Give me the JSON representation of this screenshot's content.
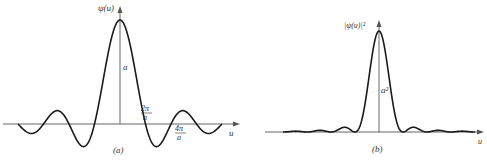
{
  "figure": {
    "panels": [
      {
        "id": "a",
        "caption": "(a)",
        "y_label": "ψ(u)",
        "x_label": "u",
        "peak_label": "a",
        "tick_labels": [
          {
            "num": "2π",
            "den": "a"
          },
          {
            "num": "4π",
            "den": "a"
          }
        ]
      },
      {
        "id": "b",
        "caption": "(b)",
        "y_label": "|ψ(u)|²",
        "x_label": "u",
        "peak_label": "a²"
      }
    ]
  },
  "chart_data": [
    {
      "type": "line",
      "title": "(a)",
      "function": "ψ(u) = a·sin(au/2)/(au/2)",
      "xlabel": "u",
      "ylabel": "ψ(u)",
      "peak_value": "a",
      "zeros_marked": [
        "2π/a",
        "4π/a"
      ],
      "x_range_in_zero_units": [
        -4,
        4
      ],
      "grid": false
    },
    {
      "type": "line",
      "title": "(b)",
      "function": "|ψ(u)|² = a²·[sin(au/2)/(au/2)]²",
      "xlabel": "u",
      "ylabel": "|ψ(u)|²",
      "peak_value": "a²",
      "x_range_in_zero_units": [
        -4,
        4
      ],
      "grid": false
    }
  ],
  "colors": {
    "curve": "#1a1a1a",
    "axis": "#555555",
    "text": "#333333"
  }
}
